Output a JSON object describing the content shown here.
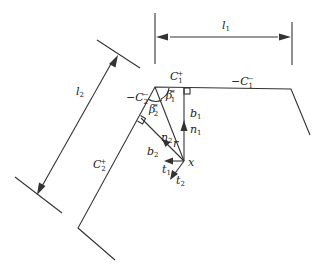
{
  "diagram": {
    "type": "geometric-construction",
    "colors": {
      "stroke": "#333333",
      "text": "#222222",
      "background": "#ffffff"
    },
    "dimensions": {
      "l1": {
        "base": "l",
        "sub": "1"
      },
      "l2": {
        "base": "l",
        "sub": "2"
      }
    },
    "edges": {
      "c1_plus": {
        "prefix": "",
        "base": "C",
        "sub": "1",
        "sup": "+"
      },
      "c1_minus": {
        "prefix": "−",
        "base": "C",
        "sub": "1",
        "sup": "−"
      },
      "c2_minus": {
        "prefix": "−",
        "base": "C",
        "sub": "2",
        "sup": "−"
      },
      "c2_plus": {
        "prefix": "",
        "base": "C",
        "sub": "2",
        "sup": "+"
      }
    },
    "angles": {
      "beta1": {
        "base": "β",
        "sub": "1",
        "sup": "*"
      },
      "beta2": {
        "base": "β",
        "sub": "2",
        "sup": "*"
      }
    },
    "segments": {
      "b1": {
        "base": "b",
        "sub": "1"
      },
      "b2": {
        "base": "b",
        "sub": "2"
      },
      "r": {
        "base": "r"
      }
    },
    "vectors": {
      "n1": {
        "base": "n",
        "sub": "1"
      },
      "n2": {
        "base": "n",
        "sub": "2"
      },
      "t1": {
        "base": "t",
        "sub": "1"
      },
      "t2": {
        "base": "t",
        "sub": "2"
      }
    },
    "points": {
      "x": {
        "base": "x"
      }
    }
  }
}
